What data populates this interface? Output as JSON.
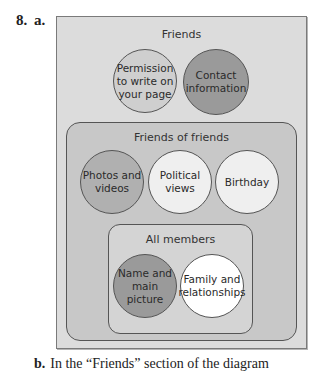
{
  "question": {
    "number": "8.",
    "part_a": "a.",
    "part_b_label": "b.",
    "part_b_text": "In the “Friends” section of the diagram"
  },
  "diagram": {
    "sections": [
      {
        "title": "Friends",
        "circles": [
          {
            "label": "Permission to write on your page",
            "shade": "light"
          },
          {
            "label": "Contact information",
            "shade": "dark"
          }
        ]
      },
      {
        "title": "Friends of friends",
        "circles": [
          {
            "label": "Photos and videos",
            "shade": "medium"
          },
          {
            "label": "Political views",
            "shade": "pale"
          },
          {
            "label": "Birthday",
            "shade": "pale"
          }
        ]
      },
      {
        "title": "All members",
        "circles": [
          {
            "label": "Name and main picture",
            "shade": "dark"
          },
          {
            "label": "Family and relationships",
            "shade": "white"
          }
        ]
      }
    ]
  }
}
